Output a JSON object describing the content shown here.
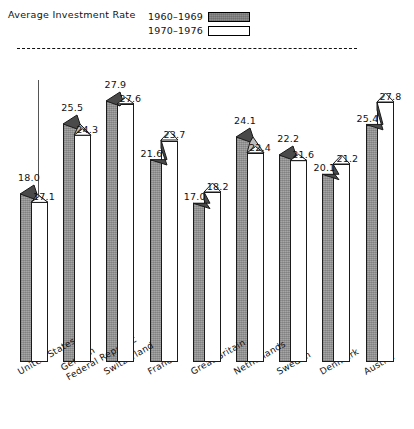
{
  "legend": {
    "title": "Average Investment Rate",
    "entries": [
      {
        "label": "1960–1969",
        "swatch": "shaded-swatch"
      },
      {
        "label": "1970–1976",
        "swatch": "white-swatch"
      }
    ]
  },
  "chart_data": {
    "type": "bar",
    "title": "Average Investment Rate",
    "xlabel": "",
    "ylabel": "",
    "ylim": [
      0,
      30
    ],
    "grid": false,
    "legend_position": "top-right",
    "annotations": [
      {
        "type": "reference-line",
        "style": "dashed",
        "value": 28.0
      }
    ],
    "categories": [
      "United States",
      "German Federal Republic",
      "Switzerland",
      "France",
      "Great Britain",
      "Netherlands",
      "Sweden",
      "Denmark",
      "Austria"
    ],
    "series": [
      {
        "name": "1960–1969",
        "values": [
          18.0,
          25.5,
          27.9,
          21.6,
          17.0,
          24.1,
          22.2,
          20.1,
          25.4
        ]
      },
      {
        "name": "1970–1976",
        "values": [
          17.1,
          24.3,
          27.6,
          23.7,
          18.2,
          22.4,
          21.6,
          21.2,
          27.8
        ]
      }
    ]
  },
  "axis": {
    "category_labels": [
      {
        "line1": "United States",
        "line2": ""
      },
      {
        "line1": "German",
        "line2": "Federal Republic"
      },
      {
        "line1": "Switzerland",
        "line2": ""
      },
      {
        "line1": "France",
        "line2": ""
      },
      {
        "line1": "Great Britain",
        "line2": ""
      },
      {
        "line1": "Netherlands",
        "line2": ""
      },
      {
        "line1": "Sweden",
        "line2": ""
      },
      {
        "line1": "Denmark",
        "line2": ""
      },
      {
        "line1": "Austria",
        "line2": ""
      }
    ]
  },
  "value_labels": {
    "series_a": [
      "18.0",
      "25.5",
      "27.9",
      "21.6",
      "17.0",
      "24.1",
      "22.2",
      "20.1",
      "25.4"
    ],
    "series_b": [
      "17.1",
      "24.3",
      "27.6",
      "23.7",
      "18.2",
      "22.4",
      "21.6",
      "21.2",
      "27.8"
    ]
  },
  "colors": {
    "shaded_fill": "#a6a6a6",
    "white_fill": "#ffffff",
    "outline": "#1a1a1a",
    "cap_dark": "#4a4a4a",
    "cap_light": "#bdbdbd",
    "refline": "#111111"
  }
}
